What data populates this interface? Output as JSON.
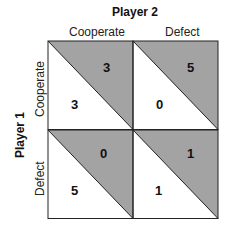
{
  "player2": {
    "label": "Player 2"
  },
  "player1": {
    "label": "Player 1"
  },
  "columns": [
    {
      "label": "Cooperate"
    },
    {
      "label": "Defect"
    }
  ],
  "rows": [
    {
      "label": "Cooperate"
    },
    {
      "label": "Defect"
    }
  ],
  "cells": [
    {
      "row": 0,
      "col": 0,
      "player1_payoff": "3",
      "player2_payoff": "3"
    },
    {
      "row": 0,
      "col": 1,
      "player1_payoff": "0",
      "player2_payoff": "5"
    },
    {
      "row": 1,
      "col": 0,
      "player1_payoff": "5",
      "player2_payoff": "0"
    },
    {
      "row": 1,
      "col": 1,
      "player1_payoff": "1",
      "player2_payoff": "1"
    }
  ],
  "colors": {
    "shade": "#a3a3a3",
    "line": "#222222",
    "background": "#ffffff"
  }
}
